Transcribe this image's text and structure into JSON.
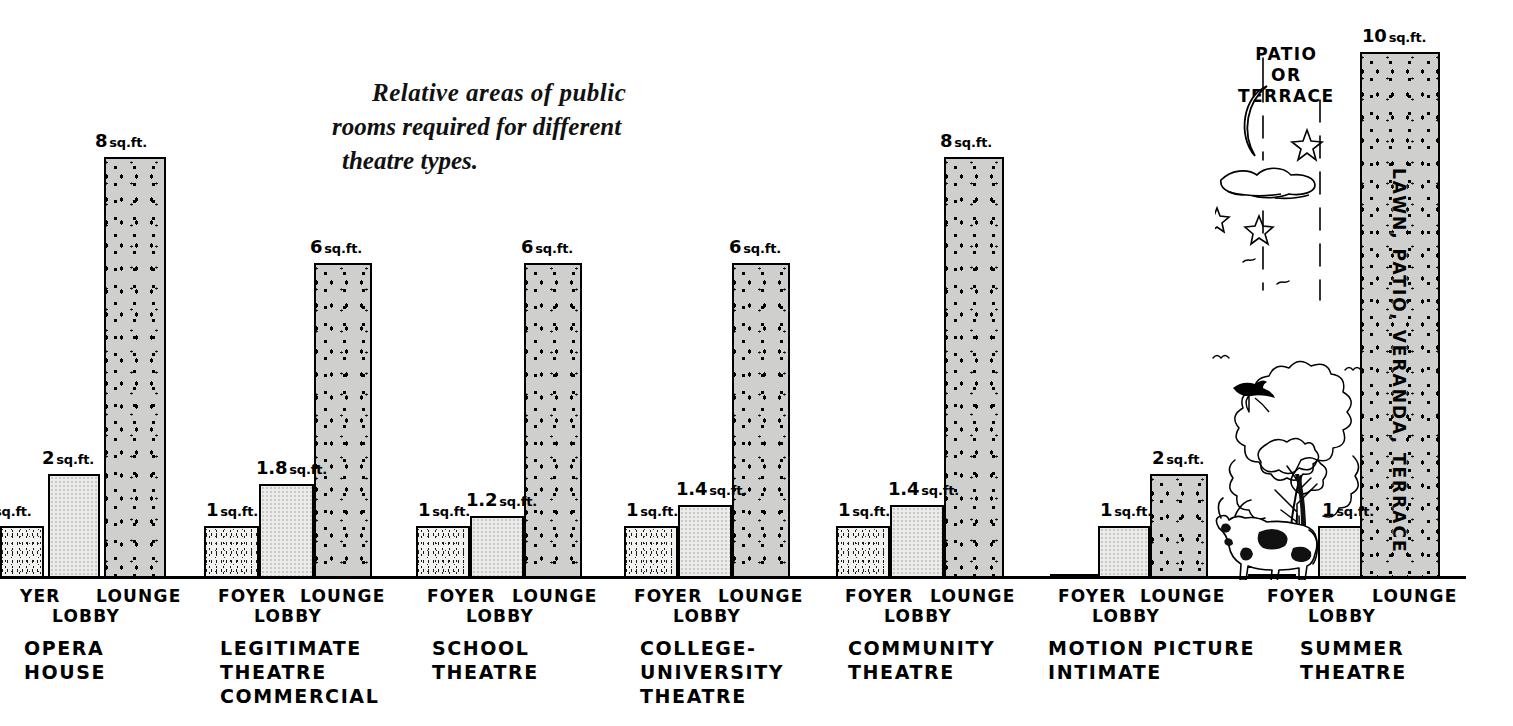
{
  "title": {
    "line1": "Relative  areas  of  public",
    "line2": "rooms required for different",
    "line3": "theatre types."
  },
  "axis": {
    "unit": "sq. ft.",
    "baseline_label": ""
  },
  "annotation": {
    "patio_line1": "PATIO",
    "patio_line2": "OR",
    "patio_line3": "TERRACE",
    "summer_lounge_vertical": "LAWN, PATIO, VERANDA, TERRACE"
  },
  "part_labels": {
    "foyer": "FOYER",
    "foyer_clipped": "YER",
    "lobby": "LOBBY",
    "lounge": "LOUNGE"
  },
  "chart_data": {
    "type": "bar",
    "title": "Relative areas of public rooms required for different theatre types.",
    "xlabel": "",
    "ylabel": "Area per seat (sq. ft.)",
    "ylim": [
      0,
      10
    ],
    "grid": false,
    "legend": "none",
    "categories": [
      "FOYER",
      "LOBBY",
      "LOUNGE"
    ],
    "groups": [
      {
        "name": "OPERA HOUSE",
        "caption_lines": [
          "OPERA",
          "HOUSE"
        ],
        "clipped_left": true,
        "bars": [
          {
            "part": "FOYER",
            "value": 1,
            "label": "sq.ft.",
            "label_num": "",
            "clipped": true
          },
          {
            "part": "LOBBY",
            "value": 2,
            "label": "2 sq.ft.",
            "label_num": "2"
          },
          {
            "part": "LOUNGE",
            "value": 8,
            "label": "8 sq.ft.",
            "label_num": "8"
          }
        ]
      },
      {
        "name": "LEGITIMATE THEATRE COMMERCIAL",
        "caption_lines": [
          "LEGITIMATE",
          "THEATRE",
          "COMMERCIAL"
        ],
        "bars": [
          {
            "part": "FOYER",
            "value": 1,
            "label": "1 sq. ft",
            "label_num": "1"
          },
          {
            "part": "LOBBY",
            "value": 1.8,
            "label": "1.8 sq.ft.",
            "label_num": "1.8"
          },
          {
            "part": "LOUNGE",
            "value": 6,
            "label": "6 sq. ft.",
            "label_num": "6"
          }
        ]
      },
      {
        "name": "SCHOOL THEATRE",
        "caption_lines": [
          "SCHOOL",
          "THEATRE"
        ],
        "bars": [
          {
            "part": "FOYER",
            "value": 1,
            "label": "1 sq. ft.",
            "label_num": "1"
          },
          {
            "part": "LOBBY",
            "value": 1.2,
            "label": "1.2 sq. ft.",
            "label_num": "1.2"
          },
          {
            "part": "LOUNGE",
            "value": 6,
            "label": "6 sq. ft.",
            "label_num": "6"
          }
        ]
      },
      {
        "name": "COLLEGE-UNIVERSITY THEATRE",
        "caption_lines": [
          "COLLEGE-",
          "UNIVERSITY",
          "THEATRE"
        ],
        "bars": [
          {
            "part": "FOYER",
            "value": 1,
            "label": "1 sq. ft.",
            "label_num": "1"
          },
          {
            "part": "LOBBY",
            "value": 1.4,
            "label": "1.4 sq. ft",
            "label_num": "1.4"
          },
          {
            "part": "LOUNGE",
            "value": 6,
            "label": "6 sq. ft.",
            "label_num": "6"
          }
        ]
      },
      {
        "name": "COMMUNITY THEATRE",
        "caption_lines": [
          "COMMUNITY",
          "THEATRE"
        ],
        "bars": [
          {
            "part": "FOYER",
            "value": 1,
            "label": "1 sq. ft.",
            "label_num": "1"
          },
          {
            "part": "LOBBY",
            "value": 1.4,
            "label": "1.4 sq. ft.",
            "label_num": "1.4"
          },
          {
            "part": "LOUNGE",
            "value": 8,
            "label": "8 sq. ft.",
            "label_num": "8"
          }
        ]
      },
      {
        "name": "MOTION PICTURE INTIMATE",
        "caption_lines": [
          "MOTION PICTURE",
          "INTIMATE"
        ],
        "bars": [
          {
            "part": "FOYER",
            "value": 0,
            "label": "",
            "label_num": ""
          },
          {
            "part": "LOBBY",
            "value": 1,
            "label": "1 sq. ft.",
            "label_num": "1"
          },
          {
            "part": "LOUNGE",
            "value": 2,
            "label": "2 sq.ft.",
            "label_num": "2"
          }
        ]
      },
      {
        "name": "SUMMER THEATRE",
        "caption_lines": [
          "SUMMER",
          "THEATRE"
        ],
        "bars": [
          {
            "part": "FOYER",
            "value": 0,
            "label": "",
            "label_num": ""
          },
          {
            "part": "LOBBY",
            "value": 1,
            "label": "1 sq.ft.",
            "label_num": "1"
          },
          {
            "part": "LOUNGE",
            "value": 10,
            "label": "10 sq.ft.",
            "label_num": "10"
          }
        ]
      }
    ]
  },
  "groups_layout": [
    {
      "id": "opera-house",
      "caption_left": 24,
      "caption_top": 636,
      "label_foyer_left": 20,
      "label_lobby_left": 52,
      "label_lounge_left": 96,
      "bars": [
        {
          "left": 0,
          "width": 44
        },
        {
          "left": 48,
          "width": 52
        },
        {
          "left": 104,
          "width": 62
        }
      ],
      "labels": [
        {
          "left": 4,
          "cut": true
        },
        {
          "left": 42
        },
        {
          "left": 95
        }
      ]
    },
    {
      "id": "legitimate-theatre",
      "caption_left": 220,
      "caption_top": 636,
      "label_foyer_left": 218,
      "label_lobby_left": 254,
      "label_lounge_left": 300,
      "bars": [
        {
          "left": 204,
          "width": 55
        },
        {
          "left": 259,
          "width": 55
        },
        {
          "left": 314,
          "width": 58
        }
      ],
      "labels": [
        {
          "left": 206
        },
        {
          "left": 256
        },
        {
          "left": 310
        }
      ]
    },
    {
      "id": "school-theatre",
      "caption_left": 432,
      "caption_top": 636,
      "label_foyer_left": 427,
      "label_lobby_left": 466,
      "label_lounge_left": 512,
      "bars": [
        {
          "left": 416,
          "width": 54
        },
        {
          "left": 470,
          "width": 54
        },
        {
          "left": 524,
          "width": 58
        }
      ],
      "labels": [
        {
          "left": 418
        },
        {
          "left": 466
        },
        {
          "left": 521
        }
      ]
    },
    {
      "id": "college-university-theatre",
      "caption_left": 640,
      "caption_top": 636,
      "label_foyer_left": 634,
      "label_lobby_left": 673,
      "label_lounge_left": 718,
      "bars": [
        {
          "left": 624,
          "width": 54
        },
        {
          "left": 678,
          "width": 54
        },
        {
          "left": 732,
          "width": 58
        }
      ],
      "labels": [
        {
          "left": 626
        },
        {
          "left": 676
        },
        {
          "left": 729
        }
      ]
    },
    {
      "id": "community-theatre",
      "caption_left": 848,
      "caption_top": 636,
      "label_foyer_left": 845,
      "label_lobby_left": 884,
      "label_lounge_left": 930,
      "bars": [
        {
          "left": 836,
          "width": 54
        },
        {
          "left": 890,
          "width": 54
        },
        {
          "left": 944,
          "width": 60
        }
      ],
      "labels": [
        {
          "left": 838
        },
        {
          "left": 888
        },
        {
          "left": 940
        }
      ]
    },
    {
      "id": "motion-picture-intimate",
      "caption_left": 1048,
      "caption_top": 636,
      "label_foyer_left": 1058,
      "label_lobby_left": 1092,
      "label_lounge_left": 1140,
      "bars": [
        {
          "left": 1050,
          "width": 48
        },
        {
          "left": 1098,
          "width": 52
        },
        {
          "left": 1150,
          "width": 58
        }
      ],
      "labels": [
        {
          "left": 1052
        },
        {
          "left": 1100
        },
        {
          "left": 1152
        }
      ]
    },
    {
      "id": "summer-theatre",
      "caption_left": 1300,
      "caption_top": 636,
      "label_foyer_left": 1267,
      "label_lobby_left": 1308,
      "label_lounge_left": 1372,
      "bars": [
        {
          "left": 1248,
          "width": 48
        },
        {
          "left": 1318,
          "width": 54
        },
        {
          "left": 1360,
          "width": 80
        }
      ],
      "labels": [
        {
          "left": 1250
        },
        {
          "left": 1322
        },
        {
          "left": 1362
        }
      ]
    }
  ],
  "scale": {
    "baseline_y": 576,
    "px_per_unit": 52.7,
    "baseline_width": 1466
  }
}
